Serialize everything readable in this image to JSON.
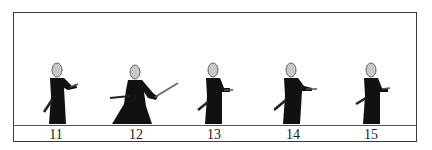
{
  "diagram": {
    "type": "kendo-kata-sequence",
    "frames": [
      {
        "number": "11",
        "pose": "standing-sword-forward"
      },
      {
        "number": "12",
        "pose": "wide-stance-sword-raised-diagonal"
      },
      {
        "number": "13",
        "pose": "standing-sword-forward"
      },
      {
        "number": "14",
        "pose": "standing-sword-forward"
      },
      {
        "number": "15",
        "pose": "standing-sword-forward"
      }
    ],
    "colors": {
      "figure": "#111111",
      "head": "#c8c8c8",
      "frame": "#3a3a3a"
    }
  }
}
